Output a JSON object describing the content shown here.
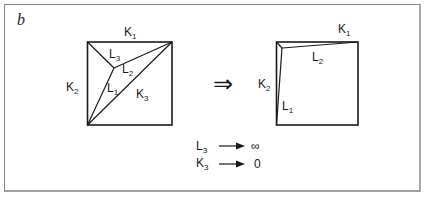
{
  "panel_label": "b",
  "left_diagram": {
    "edges": {
      "top": {
        "base": "K",
        "sub": "1"
      },
      "left": {
        "base": "K",
        "sub": "2"
      }
    },
    "internal": [
      {
        "base": "L",
        "sub": "3"
      },
      {
        "base": "L",
        "sub": "2"
      },
      {
        "base": "L",
        "sub": "1"
      },
      {
        "base": "K",
        "sub": "3"
      }
    ]
  },
  "implies_symbol": "⇒",
  "right_diagram": {
    "edges": {
      "top": {
        "base": "K",
        "sub": "1"
      },
      "left": {
        "base": "K",
        "sub": "2"
      }
    },
    "internal": [
      {
        "base": "L",
        "sub": "2"
      },
      {
        "base": "L",
        "sub": "1"
      }
    ]
  },
  "limits": [
    {
      "base": "L",
      "sub": "3",
      "arrow": "→",
      "value": "∞"
    },
    {
      "base": "K",
      "sub": "3",
      "arrow": "→",
      "value": "0"
    }
  ]
}
